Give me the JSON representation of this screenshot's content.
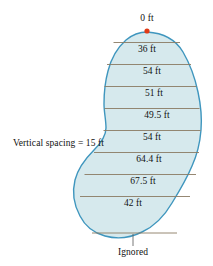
{
  "figure": {
    "apex_marker": {
      "label": "0 ft",
      "color": "#e03a16",
      "x": 147,
      "y": 31
    },
    "region": {
      "fill_color": "#d6e9ed",
      "outline_color": "#3f96be",
      "chord_color": "#8a7a63"
    },
    "spacing_note": {
      "label": "Vertical spacing = 15 ft"
    },
    "ignored_note": {
      "label": "Ignored"
    },
    "measurements": [
      {
        "label": "36 ft",
        "y": 47,
        "center_x": 147
      },
      {
        "label": "54 ft",
        "y": 69,
        "center_x": 152
      },
      {
        "label": "51 ft",
        "y": 91,
        "center_x": 154
      },
      {
        "label": "49.5 ft",
        "y": 113,
        "center_x": 157
      },
      {
        "label": "54 ft",
        "y": 135,
        "center_x": 152
      },
      {
        "label": "64.4 ft",
        "y": 157,
        "center_x": 149
      },
      {
        "label": "67.5 ft",
        "y": 179,
        "center_x": 143
      },
      {
        "label": "42 ft",
        "y": 201,
        "center_x": 133
      }
    ],
    "chord_lines": [
      {
        "y": 42.5,
        "x1": 113.5,
        "x2": 180.0
      },
      {
        "y": 64.5,
        "x1": 107.0,
        "x2": 191.0
      },
      {
        "y": 86.5,
        "x1": 104.5,
        "x2": 196.5
      },
      {
        "y": 108.5,
        "x1": 104.5,
        "x2": 199.5
      },
      {
        "y": 130.5,
        "x1": 103.5,
        "x2": 200.5
      },
      {
        "y": 152.5,
        "x1": 94.0,
        "x2": 199.0
      },
      {
        "y": 174.5,
        "x1": 84.5,
        "x2": 196.0
      },
      {
        "y": 196.5,
        "x1": 80.0,
        "x2": 190.0
      },
      {
        "y": 233.0,
        "x1": 92.0,
        "x2": 177.0
      }
    ]
  }
}
